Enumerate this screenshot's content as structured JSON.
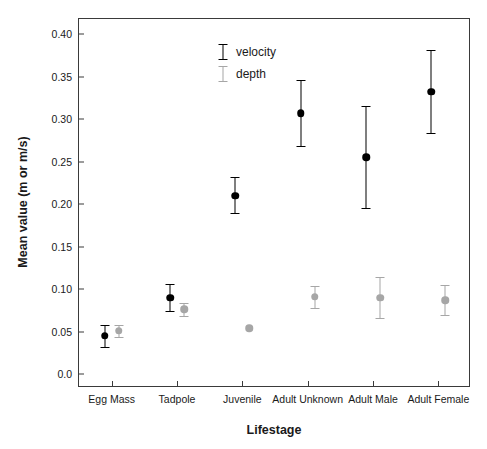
{
  "chart_data": {
    "type": "scatter",
    "title": "",
    "xlabel": "Lifestage",
    "ylabel": "Mean value (m or m/s)",
    "categories": [
      "Egg Mass",
      "Tadpole",
      "Juvenile",
      "Adult Unknown",
      "Adult Male",
      "Adult Female"
    ],
    "ylim": [
      0.0,
      0.42
    ],
    "yticks": [
      0.0,
      0.05,
      0.1,
      0.15,
      0.2,
      0.25,
      0.3,
      0.35,
      0.4
    ],
    "ytick_labels": [
      "0.0",
      "0.05",
      "0.10",
      "0.15",
      "0.20",
      "0.25",
      "0.30",
      "0.35",
      "0.40"
    ],
    "grid": false,
    "legend_position": "top-left-inside",
    "series": [
      {
        "name": "velocity",
        "color": "#000000",
        "marker": "filled-circle",
        "values": [
          0.045,
          0.09,
          0.21,
          0.307,
          0.255,
          0.332
        ],
        "err_low": [
          0.032,
          0.074,
          0.189,
          0.268,
          0.195,
          0.283
        ],
        "err_high": [
          0.058,
          0.106,
          0.232,
          0.346,
          0.315,
          0.381
        ]
      },
      {
        "name": "depth",
        "color": "#a6a6a6",
        "marker": "filled-circle",
        "values": [
          0.051,
          0.076,
          0.054,
          0.091,
          0.09,
          0.087
        ],
        "err_low": [
          0.044,
          0.068,
          null,
          0.078,
          0.066,
          0.069
        ],
        "err_high": [
          0.058,
          0.084,
          null,
          0.104,
          0.114,
          0.105
        ]
      }
    ]
  },
  "legend": {
    "items": [
      {
        "label": "velocity",
        "color": "#000000"
      },
      {
        "label": "depth",
        "color": "#a6a6a6"
      }
    ]
  }
}
